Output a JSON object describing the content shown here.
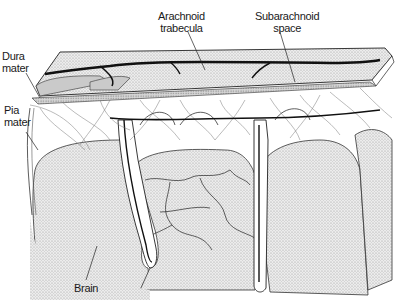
{
  "diagram": {
    "labels": {
      "dura_mater": {
        "line1": "Dura",
        "line2": "mater"
      },
      "pia_mater": {
        "line1": "Pia",
        "line2": "mater"
      },
      "arachnoid_trabecula": {
        "line1": "Arachnoid",
        "line2": "trabecula"
      },
      "subarachnoid_space": {
        "line1": "Subarachnoid",
        "line2": "space"
      },
      "brain": {
        "line1": "Brain"
      }
    },
    "colors": {
      "ink": "#1a1a1a",
      "stipple_fill": "#d9d9d9",
      "dura_fill": "#cfcfcf",
      "background": "#ffffff"
    }
  }
}
